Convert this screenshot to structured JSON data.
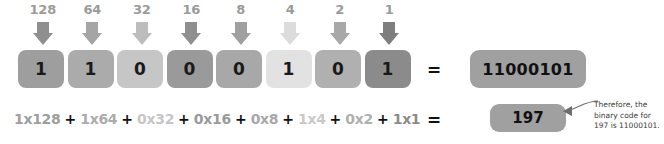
{
  "diagram": {
    "place_values": [
      "128",
      "64",
      "32",
      "16",
      "8",
      "4",
      "2",
      "1"
    ],
    "bits": [
      "1",
      "1",
      "0",
      "0",
      "0",
      "1",
      "0",
      "1"
    ],
    "box_colors": [
      "#9e9e9e",
      "#ababab",
      "#c6c6c6",
      "#9a9a9a",
      "#a8a8a8",
      "#e2e2e2",
      "#b0b0b0",
      "#8b8b8b"
    ],
    "arrow_colors": [
      "#8f8f8f",
      "#a5a5a5",
      "#bdbdbd",
      "#8f8f8f",
      "#a0a0a0",
      "#dcdcdc",
      "#a8a8a8",
      "#7e7e7e"
    ],
    "label_color": "#9b9b9b",
    "equation_terms": [
      "1x128",
      "1x64",
      "0x32",
      "0x16",
      "0x8",
      "1x4",
      "0x2",
      "1x1"
    ],
    "equation_colors": [
      "#9e9e9e",
      "#ababab",
      "#c6c6c6",
      "#9a9a9a",
      "#a8a8a8",
      "#c9c9c9",
      "#b0b0b0",
      "#8b8b8b"
    ],
    "plus_sign": "+",
    "equals_top": "=",
    "equals_bottom": "=",
    "binary_result": "11000101",
    "decimal_result": "197",
    "annotation": "Therefore, the binary code for 197 is 11000101."
  }
}
